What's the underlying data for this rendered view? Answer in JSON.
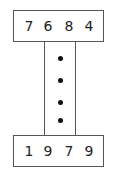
{
  "diagram": {
    "top_number": [
      "7",
      "6",
      "8",
      "4"
    ],
    "bottom_number": [
      "1",
      "9",
      "7",
      "9"
    ],
    "connector_dots": 4
  }
}
